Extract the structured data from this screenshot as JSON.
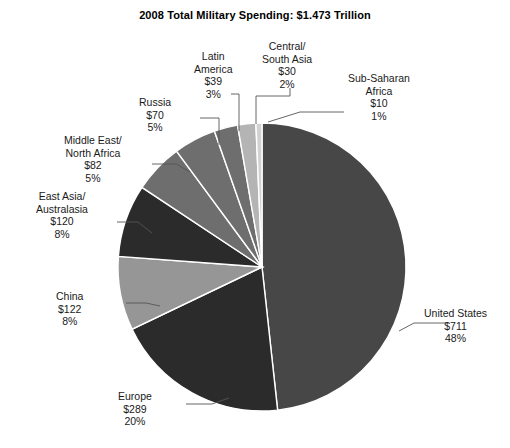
{
  "chart_data": {
    "type": "pie",
    "title": "2008 Total Military Spending: $1.473 Trillion",
    "xlabel": "",
    "ylabel": "",
    "legend": "none",
    "grid": false,
    "total_label": "$1.473 Trillion",
    "units": "billions of USD",
    "categories": [
      "United States",
      "Europe",
      "China",
      "East Asia/Australasia",
      "Middle East/North Africa",
      "Russia",
      "Latin America",
      "Central/South Asia",
      "Sub-Saharan Africa"
    ],
    "values": [
      711,
      289,
      122,
      120,
      82,
      70,
      39,
      30,
      10
    ],
    "percents": [
      48,
      20,
      8,
      8,
      5,
      5,
      3,
      2,
      1
    ],
    "colors": [
      "#474747",
      "#2b2b2b",
      "#969696",
      "#2b2b2b",
      "#6e6e6e",
      "#6e6e6e",
      "#6e6e6e",
      "#b4b4b4",
      "#d2d2d2"
    ],
    "slices": [
      {
        "name": "United States",
        "value_label": "$711",
        "pct_label": "48%",
        "value": 711,
        "pct": 48,
        "color": "#474747"
      },
      {
        "name": "Europe",
        "value_label": "$289",
        "pct_label": "20%",
        "value": 289,
        "pct": 20,
        "color": "#2b2b2b"
      },
      {
        "name": "China",
        "value_label": "$122",
        "pct_label": "8%",
        "value": 122,
        "pct": 8,
        "color": "#969696"
      },
      {
        "name": "East Asia/Australasia",
        "value_label": "$120",
        "pct_label": "8%",
        "value": 120,
        "pct": 8,
        "color": "#2b2b2b"
      },
      {
        "name": "Middle East/North Africa",
        "value_label": "$82",
        "pct_label": "5%",
        "value": 82,
        "pct": 5,
        "color": "#6e6e6e"
      },
      {
        "name": "Russia",
        "value_label": "$70",
        "pct_label": "5%",
        "value": 70,
        "pct": 5,
        "color": "#6e6e6e"
      },
      {
        "name": "Latin America",
        "value_label": "$39",
        "pct_label": "3%",
        "value": 39,
        "pct": 3,
        "color": "#6e6e6e"
      },
      {
        "name": "Central/South Asia",
        "value_label": "$30",
        "pct_label": "2%",
        "value": 30,
        "pct": 2,
        "color": "#b4b4b4"
      },
      {
        "name": "Sub-Saharan Africa",
        "value_label": "$10",
        "pct_label": "1%",
        "value": 10,
        "pct": 1,
        "color": "#d2d2d2"
      }
    ]
  },
  "labels": {
    "united_states": {
      "line1": "United States",
      "line2": "$711",
      "line3": "48%"
    },
    "europe": {
      "line1": "Europe",
      "line2": "$289",
      "line3": "20%"
    },
    "china": {
      "line1": "China",
      "line2": "$122",
      "line3": "8%"
    },
    "east_asia": {
      "line1": "East Asia/",
      "line1b": "Australasia",
      "line2": "$120",
      "line3": "8%"
    },
    "middle_east": {
      "line1": "Middle East/",
      "line1b": "North Africa",
      "line2": "$82",
      "line3": "5%"
    },
    "russia": {
      "line1": "Russia",
      "line2": "$70",
      "line3": "5%"
    },
    "latin_america": {
      "line1": "Latin",
      "line1b": "America",
      "line2": "$39",
      "line3": "3%"
    },
    "central_asia": {
      "line1": "Central/",
      "line1b": "South Asia",
      "line2": "$30",
      "line3": "2%"
    },
    "subsaharan": {
      "line1": "Sub-Saharan",
      "line1b": "Africa",
      "line2": "$10",
      "line3": "1%"
    }
  },
  "style": {
    "background": "#ffffff",
    "title_color": "#000000",
    "label_color": "#1a1a1a",
    "leader_color": "#555555",
    "slice_border": "#ffffff"
  }
}
